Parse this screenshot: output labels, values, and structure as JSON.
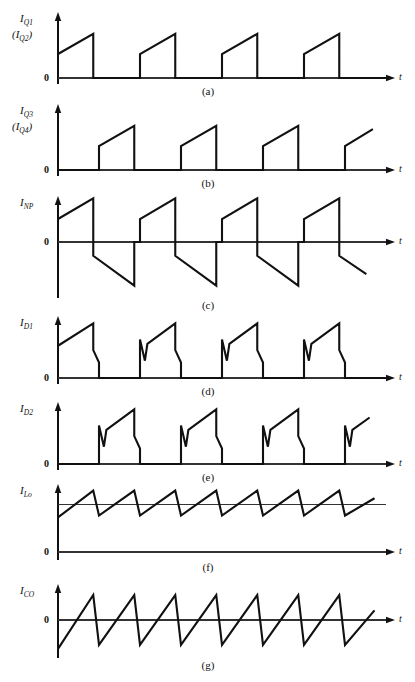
{
  "figure": {
    "width": 415,
    "height": 682,
    "axis_label_t": "t",
    "zero_label": "0",
    "stroke_color": "#111111",
    "axis_color": "#333333",
    "background": "#ffffff"
  },
  "chart_data": {
    "type": "line",
    "xlabel": "t",
    "ylabel": "",
    "grid": false,
    "legend": "none",
    "x": [
      0,
      1,
      2,
      3,
      4
    ],
    "panels": [
      {
        "id": "a",
        "caption": "(a)",
        "ylabel": "I_Q1",
        "ylabel_sub": "Q1",
        "ylabel_alt": "(I_Q2)",
        "ylabel_alt_sub": "Q2",
        "has_negative": false,
        "baseline_value": 0,
        "points": [
          [
            0.0,
            0.5
          ],
          [
            0.215,
            0.92
          ],
          [
            0.215,
            0.0
          ],
          [
            0.5,
            0.0
          ],
          [
            0.5,
            0.5
          ],
          [
            0.715,
            0.92
          ],
          [
            0.715,
            0.0
          ],
          [
            1.0,
            0.0
          ],
          [
            1.0,
            0.5
          ],
          [
            1.215,
            0.92
          ],
          [
            1.215,
            0.0
          ],
          [
            1.5,
            0.0
          ],
          [
            1.5,
            0.5
          ],
          [
            1.715,
            0.92
          ],
          [
            1.715,
            0.0
          ],
          [
            2.0,
            0.0
          ]
        ],
        "notes": "Transistor Q1 (and Q2) current: rising ramp pulses with ~43% duty, zero between pulses."
      },
      {
        "id": "b",
        "caption": "(b)",
        "ylabel": "I_Q3",
        "ylabel_sub": "Q3",
        "ylabel_alt": "(I_Q4)",
        "ylabel_alt_sub": "Q4",
        "has_negative": false,
        "baseline_value": 0,
        "points": [
          [
            0.0,
            0.0
          ],
          [
            0.25,
            0.0
          ],
          [
            0.25,
            0.5
          ],
          [
            0.465,
            0.92
          ],
          [
            0.465,
            0.0
          ],
          [
            0.75,
            0.0
          ],
          [
            0.75,
            0.5
          ],
          [
            0.965,
            0.92
          ],
          [
            0.965,
            0.0
          ],
          [
            1.25,
            0.0
          ],
          [
            1.25,
            0.5
          ],
          [
            1.465,
            0.92
          ],
          [
            1.465,
            0.0
          ],
          [
            1.75,
            0.0
          ],
          [
            1.75,
            0.5
          ],
          [
            1.92,
            0.85
          ]
        ],
        "notes": "Transistor Q3 (and Q4) current: identical ramp pulses phase shifted by half a period from (a); last pulse truncated at right edge."
      },
      {
        "id": "c",
        "caption": "(c)",
        "ylabel": "I_NP",
        "ylabel_sub": "NP",
        "has_negative": true,
        "baseline_value": 0,
        "points": [
          [
            0.0,
            0.5
          ],
          [
            0.215,
            0.95
          ],
          [
            0.215,
            -0.3
          ],
          [
            0.465,
            -0.95
          ],
          [
            0.465,
            0.0
          ],
          [
            0.5,
            0.0
          ],
          [
            0.5,
            0.5
          ],
          [
            0.715,
            0.95
          ],
          [
            0.715,
            -0.3
          ],
          [
            0.965,
            -0.95
          ],
          [
            0.965,
            0.0
          ],
          [
            1.0,
            0.0
          ],
          [
            1.0,
            0.5
          ],
          [
            1.215,
            0.95
          ],
          [
            1.215,
            -0.3
          ],
          [
            1.465,
            -0.95
          ],
          [
            1.465,
            0.0
          ],
          [
            1.5,
            0.0
          ],
          [
            1.5,
            0.5
          ],
          [
            1.715,
            0.95
          ],
          [
            1.715,
            -0.3
          ],
          [
            1.88,
            -0.7
          ]
        ],
        "notes": "Primary winding current I_NP: bipolar, alternating positive and negative ramps about zero; last negative ramp truncated."
      },
      {
        "id": "d",
        "caption": "(d)",
        "ylabel": "I_D1",
        "ylabel_sub": "D1",
        "has_negative": false,
        "baseline_value": 0,
        "points": [
          [
            0.0,
            0.52
          ],
          [
            0.215,
            0.88
          ],
          [
            0.215,
            0.45
          ],
          [
            0.25,
            0.25
          ],
          [
            0.25,
            0.0
          ],
          [
            0.5,
            0.0
          ],
          [
            0.5,
            0.62
          ],
          [
            0.53,
            0.28
          ],
          [
            0.545,
            0.55
          ],
          [
            0.715,
            0.88
          ],
          [
            0.715,
            0.45
          ],
          [
            0.75,
            0.25
          ],
          [
            0.75,
            0.0
          ],
          [
            1.0,
            0.0
          ],
          [
            1.0,
            0.62
          ],
          [
            1.03,
            0.28
          ],
          [
            1.045,
            0.55
          ],
          [
            1.215,
            0.88
          ],
          [
            1.215,
            0.45
          ],
          [
            1.25,
            0.25
          ],
          [
            1.25,
            0.0
          ],
          [
            1.5,
            0.0
          ],
          [
            1.5,
            0.62
          ],
          [
            1.53,
            0.28
          ],
          [
            1.545,
            0.55
          ],
          [
            1.715,
            0.88
          ],
          [
            1.715,
            0.45
          ],
          [
            1.75,
            0.25
          ],
          [
            1.75,
            0.0
          ],
          [
            2.0,
            0.0
          ]
        ],
        "notes": "Output rectifier diode D1 current: leading spike-notch, then rising ramp, then two-step fall to zero."
      },
      {
        "id": "e",
        "caption": "(e)",
        "ylabel": "I_D2",
        "ylabel_sub": "D2",
        "has_negative": false,
        "baseline_value": 0,
        "points": [
          [
            0.0,
            0.0
          ],
          [
            0.25,
            0.0
          ],
          [
            0.25,
            0.62
          ],
          [
            0.28,
            0.28
          ],
          [
            0.295,
            0.55
          ],
          [
            0.465,
            0.88
          ],
          [
            0.465,
            0.45
          ],
          [
            0.5,
            0.25
          ],
          [
            0.5,
            0.0
          ],
          [
            0.75,
            0.0
          ],
          [
            0.75,
            0.62
          ],
          [
            0.78,
            0.28
          ],
          [
            0.795,
            0.55
          ],
          [
            0.965,
            0.88
          ],
          [
            0.965,
            0.45
          ],
          [
            1.0,
            0.25
          ],
          [
            1.0,
            0.0
          ],
          [
            1.25,
            0.0
          ],
          [
            1.25,
            0.62
          ],
          [
            1.28,
            0.28
          ],
          [
            1.295,
            0.55
          ],
          [
            1.465,
            0.88
          ],
          [
            1.465,
            0.45
          ],
          [
            1.5,
            0.25
          ],
          [
            1.5,
            0.0
          ],
          [
            1.75,
            0.0
          ],
          [
            1.75,
            0.62
          ],
          [
            1.78,
            0.28
          ],
          [
            1.795,
            0.55
          ],
          [
            1.9,
            0.75
          ]
        ],
        "notes": "Output rectifier diode D2 current: same shape as (d), phase shifted by half a period; last pulse truncated."
      },
      {
        "id": "f",
        "caption": "(f)",
        "ylabel": "I_Lo",
        "ylabel_sub": "Lo",
        "has_negative": false,
        "baseline_value": 0,
        "average_level": 0.5,
        "show_average_line": true,
        "points": [
          [
            0.0,
            0.36
          ],
          [
            0.215,
            0.64
          ],
          [
            0.25,
            0.38
          ],
          [
            0.465,
            0.64
          ],
          [
            0.5,
            0.38
          ],
          [
            0.715,
            0.64
          ],
          [
            0.75,
            0.38
          ],
          [
            0.965,
            0.64
          ],
          [
            1.0,
            0.38
          ],
          [
            1.215,
            0.64
          ],
          [
            1.25,
            0.38
          ],
          [
            1.465,
            0.64
          ],
          [
            1.5,
            0.38
          ],
          [
            1.715,
            0.64
          ],
          [
            1.75,
            0.38
          ],
          [
            1.93,
            0.56
          ]
        ],
        "notes": "Output filter inductor current I_Lo: triangular ripple riding on a DC average level, eight ripple cycles at twice switching frequency. Thin horizontal line marks the DC average."
      },
      {
        "id": "g",
        "caption": "(g)",
        "ylabel": "I_CO",
        "ylabel_sub": "CO",
        "has_negative": true,
        "baseline_value": 0,
        "points": [
          [
            0.0,
            -0.3
          ],
          [
            0.215,
            0.26
          ],
          [
            0.25,
            -0.26
          ],
          [
            0.465,
            0.26
          ],
          [
            0.5,
            -0.26
          ],
          [
            0.715,
            0.26
          ],
          [
            0.75,
            -0.26
          ],
          [
            0.965,
            0.26
          ],
          [
            1.0,
            -0.26
          ],
          [
            1.215,
            0.26
          ],
          [
            1.25,
            -0.26
          ],
          [
            1.465,
            0.26
          ],
          [
            1.5,
            -0.26
          ],
          [
            1.715,
            0.26
          ],
          [
            1.75,
            -0.26
          ],
          [
            1.93,
            0.1
          ]
        ],
        "notes": "Output capacitor current I_CO: same triangular ripple as (f) but with the DC component removed, symmetric about zero."
      }
    ]
  }
}
